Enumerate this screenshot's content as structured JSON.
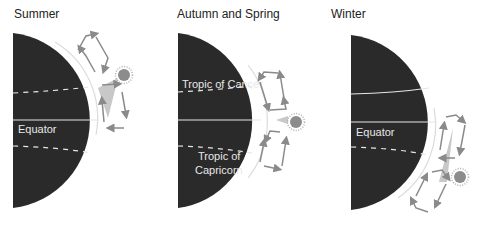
{
  "panels": [
    {
      "title": "Summer",
      "labels": {
        "equator": "Equator"
      },
      "sun_position": "north"
    },
    {
      "title": "Autumn and Spring",
      "labels": {
        "tropic_cancer": "Tropic of Cancer",
        "tropic_capricorn_1": "Tropic of",
        "tropic_capricorn_2": "Capricorn"
      },
      "sun_position": "equator"
    },
    {
      "title": "Winter",
      "labels": {
        "equator": "Equator"
      },
      "sun_position": "south"
    }
  ],
  "colors": {
    "earth": "#2a2a2a",
    "lines": "#e6e6e6",
    "arrows": "#8a8a8a",
    "ray": "#c8c8c8",
    "sun": "#8c8c8c"
  }
}
